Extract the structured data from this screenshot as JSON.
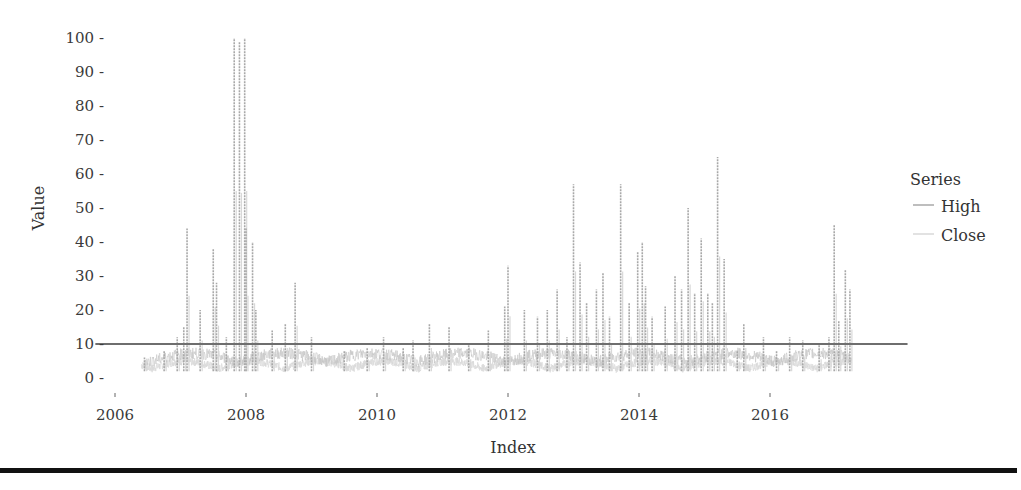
{
  "chart_data": {
    "type": "line",
    "title": "",
    "xlabel": "Index",
    "ylabel": "Value",
    "xlim": [
      2005.8,
      2017.2
    ],
    "ylim": [
      -3,
      103
    ],
    "x_ticks": [
      2006,
      2008,
      2010,
      2012,
      2014,
      2016
    ],
    "x_tick_labels": [
      "2006",
      "2008",
      "2010",
      "2012",
      "2014",
      "2016"
    ],
    "y_ticks": [
      0,
      10,
      20,
      30,
      40,
      50,
      60,
      70,
      80,
      90,
      100
    ],
    "y_tick_labels": [
      "0",
      "10",
      "20",
      "30",
      "40",
      "50",
      "60",
      "70",
      "80",
      "90",
      "100"
    ],
    "grid": false,
    "legend": {
      "title": "Series",
      "position": "right",
      "entries": [
        "High",
        "Close"
      ]
    },
    "reference_line": {
      "y": 10,
      "x_start": 2005.7,
      "x_end": 2018.1,
      "color": "#6e6e6e"
    },
    "series": [
      {
        "name": "High",
        "color": "#a8a8a8",
        "note": "spike peaks of daily high series",
        "points": [
          [
            2006.45,
            6
          ],
          [
            2006.75,
            8
          ],
          [
            2006.95,
            12
          ],
          [
            2007.05,
            15
          ],
          [
            2007.1,
            44
          ],
          [
            2007.3,
            20
          ],
          [
            2007.5,
            38
          ],
          [
            2007.55,
            28
          ],
          [
            2007.7,
            12
          ],
          [
            2007.82,
            100
          ],
          [
            2007.9,
            99
          ],
          [
            2007.98,
            100
          ],
          [
            2008.0,
            44
          ],
          [
            2008.1,
            40
          ],
          [
            2008.15,
            20
          ],
          [
            2008.4,
            14
          ],
          [
            2008.6,
            16
          ],
          [
            2008.75,
            28
          ],
          [
            2009.0,
            12
          ],
          [
            2009.5,
            8
          ],
          [
            2009.85,
            9
          ],
          [
            2010.1,
            12
          ],
          [
            2010.4,
            9
          ],
          [
            2010.55,
            11
          ],
          [
            2010.8,
            16
          ],
          [
            2011.1,
            15
          ],
          [
            2011.4,
            10
          ],
          [
            2011.7,
            14
          ],
          [
            2011.95,
            21
          ],
          [
            2012.0,
            33
          ],
          [
            2012.25,
            20
          ],
          [
            2012.45,
            18
          ],
          [
            2012.6,
            20
          ],
          [
            2012.75,
            26
          ],
          [
            2012.9,
            12
          ],
          [
            2013.0,
            57
          ],
          [
            2013.1,
            34
          ],
          [
            2013.2,
            22
          ],
          [
            2013.35,
            26
          ],
          [
            2013.45,
            31
          ],
          [
            2013.55,
            18
          ],
          [
            2013.72,
            57
          ],
          [
            2013.85,
            22
          ],
          [
            2013.98,
            37
          ],
          [
            2014.05,
            40
          ],
          [
            2014.1,
            27
          ],
          [
            2014.2,
            18
          ],
          [
            2014.4,
            21
          ],
          [
            2014.55,
            30
          ],
          [
            2014.65,
            26
          ],
          [
            2014.75,
            50
          ],
          [
            2014.85,
            25
          ],
          [
            2014.95,
            41
          ],
          [
            2015.05,
            25
          ],
          [
            2015.12,
            22
          ],
          [
            2015.2,
            65
          ],
          [
            2015.3,
            35
          ],
          [
            2015.5,
            8
          ],
          [
            2015.6,
            16
          ],
          [
            2015.9,
            12
          ],
          [
            2016.1,
            8
          ],
          [
            2016.3,
            12
          ],
          [
            2016.5,
            11
          ],
          [
            2016.75,
            10
          ],
          [
            2016.9,
            12
          ],
          [
            2016.98,
            45
          ],
          [
            2017.05,
            17
          ],
          [
            2017.15,
            32
          ],
          [
            2017.22,
            26
          ]
        ]
      },
      {
        "name": "Close",
        "color": "#d8d8d8",
        "note": "dense low band roughly 0-6 across full span",
        "range_x": [
          2006.4,
          2017.25
        ],
        "typical_range": [
          0,
          6
        ]
      }
    ]
  },
  "legend": {
    "title": "Series",
    "items": [
      {
        "label": "High",
        "color": "#a8a8a8"
      },
      {
        "label": "Close",
        "color": "#d8d8d8"
      }
    ]
  },
  "axes": {
    "x_title": "Index",
    "y_title": "Value"
  }
}
